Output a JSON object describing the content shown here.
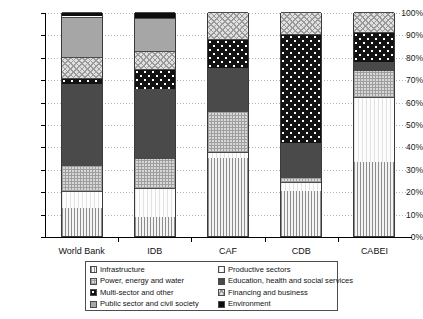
{
  "chart_data": {
    "type": "bar",
    "subtype": "stacked-percentage",
    "title": "",
    "xlabel": "",
    "ylabel": "",
    "ylim": [
      0,
      100
    ],
    "yticks": [
      "0%",
      "10%",
      "20%",
      "30%",
      "40%",
      "50%",
      "60%",
      "70%",
      "80%",
      "90%",
      "100%"
    ],
    "ytick_values": [
      0,
      10,
      20,
      30,
      40,
      50,
      60,
      70,
      80,
      90,
      100
    ],
    "grid": true,
    "legend_position": "bottom",
    "categories": [
      "World Bank",
      "IDB",
      "CAF",
      "CDB",
      "CABEI"
    ],
    "series": [
      {
        "name": "Infrastructure",
        "pattern": "vertical-lines",
        "values": [
          12.5,
          8.5,
          35.0,
          20.0,
          33.0
        ]
      },
      {
        "name": "Productive sectors",
        "pattern": "plain-white",
        "values": [
          7.5,
          13.0,
          2.5,
          4.0,
          29.0
        ]
      },
      {
        "name": "Power, energy and water",
        "pattern": "checker-light",
        "values": [
          11.5,
          13.5,
          18.5,
          2.5,
          12.0
        ]
      },
      {
        "name": "Education, health and social services",
        "pattern": "solid-dark-grey",
        "values": [
          36.5,
          30.5,
          19.0,
          15.0,
          3.5
        ]
      },
      {
        "name": "Multi-sector and other",
        "pattern": "black-with-white-dots",
        "values": [
          2.5,
          9.0,
          13.0,
          48.5,
          13.5
        ]
      },
      {
        "name": "Financing and business",
        "pattern": "diagonal-hatch",
        "values": [
          9.5,
          8.0,
          12.0,
          10.0,
          9.0
        ]
      },
      {
        "name": "Public sector and civil society",
        "pattern": "solid-medium-grey",
        "values": [
          18.0,
          15.0,
          0.0,
          0.0,
          0.0
        ]
      },
      {
        "name": "Environment",
        "pattern": "solid-black",
        "values": [
          2.0,
          2.5,
          0.0,
          0.0,
          0.0
        ]
      }
    ]
  },
  "legend": {
    "column_1": [
      {
        "label": "Infrastructure",
        "swatch": "p-infrastructure"
      },
      {
        "label": "Power, energy and water",
        "swatch": "p-power"
      },
      {
        "label": "Multi-sector and other",
        "swatch": "p-multisector"
      },
      {
        "label": "Public sector and civil society",
        "swatch": "p-publicsector"
      }
    ],
    "column_2": [
      {
        "label": "Productive sectors",
        "swatch": "p-productive"
      },
      {
        "label": "Education, health and social services",
        "swatch": "p-education"
      },
      {
        "label": "Financing and business",
        "swatch": "p-financing"
      },
      {
        "label": "Environment",
        "swatch": "p-environment"
      }
    ]
  },
  "colors": {
    "axis": "#000000",
    "gridline": "#b5b5b5",
    "background": "#ffffff",
    "bar_border": "#3a3a3a"
  }
}
